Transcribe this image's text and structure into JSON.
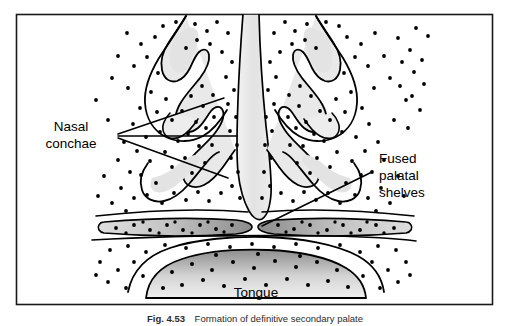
{
  "figure": {
    "title": "Formation of definitive secondary palate",
    "frame": {
      "border_color": "#1a1a1a",
      "fill_color": "#ffffff"
    },
    "labels": {
      "nasal_conchae": {
        "line1": "Nasal",
        "line2": "conchae"
      },
      "fused_palatal_shelves": {
        "line1": "Fused",
        "line2": "palatal",
        "line3": "shelves"
      },
      "tongue": "Tongue"
    },
    "caption": {
      "number": "Fig. 4.53",
      "text": "Formation of definitive secondary palate"
    },
    "colors": {
      "outline": "#000000",
      "stipple": "#000000",
      "septum_fill": "#e8e8e8",
      "concha_fill": "#e4e4e4",
      "palatal_shelf_light": "#d6d6d6",
      "palatal_shelf_dark": "#8f8f8f",
      "tongue_light": "#ededed",
      "tongue_dark": "#9a9a9a",
      "label_text": "#000000",
      "caption_text": "#2b2b2b"
    },
    "structures": [
      {
        "name": "nasal-septum",
        "description": "central vertical column widening to a bulb inferiorly"
      },
      {
        "name": "left-nasal-concha",
        "description": "scroll-shaped turbinate in left nasal cavity"
      },
      {
        "name": "right-nasal-concha",
        "description": "scroll-shaped turbinate in right nasal cavity"
      },
      {
        "name": "left-palatal-shelf",
        "description": "horizontal lens-shaped shelf fused at midline"
      },
      {
        "name": "right-palatal-shelf",
        "description": "horizontal lens-shaped shelf fused at midline"
      },
      {
        "name": "tongue",
        "description": "dome-shaped mass in floor of oral cavity"
      }
    ]
  }
}
